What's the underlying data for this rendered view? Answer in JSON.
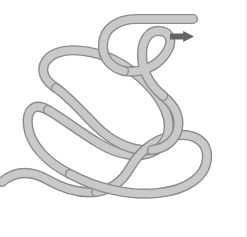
{
  "figure": {
    "width": 247,
    "height": 237,
    "background_color": "#ffffff",
    "edge_rule_color": "#e9e9e9"
  },
  "rope": {
    "label": "rope",
    "fill_color": "#c9c9c9",
    "outline_color": "#8c8c8c",
    "core_width": 7.4,
    "casing_width": 10.2,
    "free_end_label": "rope-free-end-top-right",
    "tail_label": "rope-tail-left-edge",
    "segments": [
      {
        "id": "s1",
        "name": "free-end-to-upper-left-bight",
        "d": "M 193 19 L 137 19 C 118 19 104 28 103 44 C 102 59 112 68 124 71"
      },
      {
        "id": "s2",
        "name": "upper-bight-to-right-sweep",
        "d": "M 124 71 C 140 74 158 66 166 53 C 174 41 170 32 160 31 C 149 30 142 40 142 55 C 142 72 150 85 163 96"
      },
      {
        "id": "s3",
        "name": "right-descending-limb",
        "d": "M 163 96 C 174 105 180 116 178 128 C 176 140 166 148 152 150"
      },
      {
        "id": "s4",
        "name": "under-to-left-upper-loop",
        "d": "M 152 150 C 132 152 112 142 96 126 C 80 110 68 96 56 88"
      },
      {
        "id": "s5",
        "name": "left-upper-arc",
        "d": "M 56 88 C 44 80 40 70 46 61 C 53 51 70 48 90 52 C 107 55 120 62 132 71"
      },
      {
        "id": "s6",
        "name": "right-middle-sweep",
        "d": "M 132 71 C 148 83 160 97 166 112 C 172 128 168 142 156 150"
      },
      {
        "id": "s7",
        "name": "middle-return-left",
        "d": "M 156 150 C 142 159 120 156 100 144 C 80 132 62 118 48 110"
      },
      {
        "id": "s8",
        "name": "left-outer-loop",
        "d": "M 48 110 C 34 102 26 110 28 126 C 30 144 46 162 70 174"
      },
      {
        "id": "s9",
        "name": "bottom-right-long-sweep",
        "d": "M 70 174 C 96 188 128 196 158 193 C 188 190 206 176 207 158 C 208 140 192 132 172 136"
      },
      {
        "id": "s10",
        "name": "inner-bottom-bight",
        "d": "M 172 136 C 152 140 138 154 130 168 C 122 182 110 190 96 192"
      },
      {
        "id": "s11",
        "name": "bottom-left-exit",
        "d": "M 96 192 C 78 194 62 188 48 180 C 32 171 16 170 2 182"
      }
    ]
  },
  "arrow": {
    "name": "direction-arrow",
    "color": "#666666",
    "description": "right-pointing arrow indicating pull direction of the free end",
    "x": 170,
    "y": 31,
    "width": 24,
    "height": 11
  }
}
